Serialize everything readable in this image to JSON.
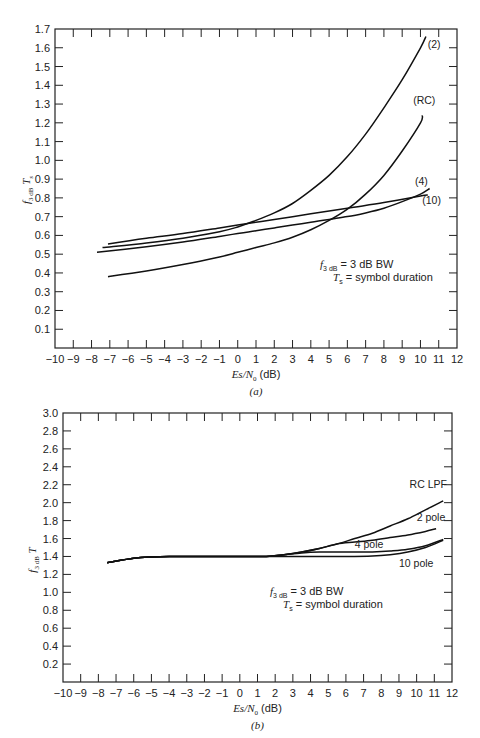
{
  "chart_data": [
    {
      "id": "a",
      "type": "line",
      "caption": "(a)",
      "xlabel": "Es/N0 (dB)",
      "ylabel": "f3dB Ts",
      "xlim": [
        -10,
        12
      ],
      "ylim": [
        0,
        1.7
      ],
      "xticks": [
        -10,
        -9,
        -8,
        -7,
        -6,
        -5,
        -4,
        -3,
        -2,
        -1,
        0,
        1,
        2,
        3,
        4,
        5,
        6,
        7,
        8,
        9,
        10,
        11,
        12
      ],
      "yticks": [
        0.1,
        0.2,
        0.3,
        0.4,
        0.5,
        0.6,
        0.7,
        0.8,
        0.9,
        1.0,
        1.1,
        1.2,
        1.3,
        1.4,
        1.5,
        1.6,
        1.7
      ],
      "grid": false,
      "annotation": [
        "f3dB = 3 dB BW",
        "Ts = symbol duration"
      ],
      "series": [
        {
          "name": "(2)",
          "x": [
            -7.4,
            -5,
            -3,
            -1,
            0,
            1,
            2,
            3,
            4,
            5,
            6,
            7,
            8,
            9,
            10,
            10.3
          ],
          "y": [
            0.535,
            0.56,
            0.585,
            0.62,
            0.645,
            0.68,
            0.72,
            0.77,
            0.84,
            0.92,
            1.02,
            1.14,
            1.28,
            1.43,
            1.6,
            1.66
          ],
          "label_pos": [
            10.4,
            1.6
          ]
        },
        {
          "name": "(RC)",
          "x": [
            -7.1,
            -5,
            -3,
            -1,
            0,
            1,
            2,
            3,
            4,
            5,
            6,
            7,
            8,
            9,
            10,
            10.1
          ],
          "y": [
            0.38,
            0.41,
            0.445,
            0.485,
            0.51,
            0.535,
            0.56,
            0.59,
            0.63,
            0.68,
            0.74,
            0.82,
            0.92,
            1.05,
            1.2,
            1.24
          ],
          "label_pos": [
            9.6,
            1.3
          ]
        },
        {
          "name": "(4)",
          "x": [
            -7.7,
            -5,
            -3,
            -1,
            0,
            1,
            2,
            3,
            4,
            5,
            6,
            7,
            8,
            9,
            10,
            10.5
          ],
          "y": [
            0.51,
            0.54,
            0.565,
            0.595,
            0.61,
            0.625,
            0.64,
            0.655,
            0.67,
            0.685,
            0.7,
            0.72,
            0.745,
            0.78,
            0.82,
            0.85
          ],
          "label_pos": [
            9.7,
            0.87
          ]
        },
        {
          "name": "(10)",
          "x": [
            -7.1,
            -5,
            -3,
            -1,
            0,
            2,
            4,
            6,
            8,
            10,
            10.4
          ],
          "y": [
            0.555,
            0.585,
            0.61,
            0.64,
            0.655,
            0.685,
            0.715,
            0.745,
            0.775,
            0.81,
            0.815
          ],
          "label_pos": [
            10.1,
            0.77
          ]
        }
      ]
    },
    {
      "id": "b",
      "type": "line",
      "caption": "(b)",
      "xlabel": "Es/N0 (dB)",
      "ylabel": "f3dB T",
      "xlim": [
        -10,
        12
      ],
      "ylim": [
        0,
        3.0
      ],
      "xticks": [
        -10,
        -9,
        -8,
        -7,
        -6,
        -5,
        -4,
        -3,
        -2,
        -1,
        0,
        1,
        2,
        3,
        4,
        5,
        6,
        7,
        8,
        9,
        10,
        11,
        12
      ],
      "yticks": [
        0.2,
        0.4,
        0.6,
        0.8,
        1.0,
        1.2,
        1.4,
        1.6,
        1.8,
        2.0,
        2.2,
        2.4,
        2.6,
        2.8,
        3.0
      ],
      "grid": false,
      "annotation": [
        "f3dB = 3 dB BW",
        "Ts = symbol duration"
      ],
      "series": [
        {
          "name": "RC LPF",
          "x": [
            -7.5,
            -6,
            -5,
            -4,
            -2,
            0,
            1.5,
            2.5,
            3.5,
            4.5,
            5.5,
            6.5,
            7.5,
            8.5,
            9.5,
            10.5,
            11.5
          ],
          "y": [
            1.33,
            1.38,
            1.395,
            1.4,
            1.4,
            1.4,
            1.4,
            1.42,
            1.45,
            1.49,
            1.54,
            1.6,
            1.66,
            1.74,
            1.82,
            1.92,
            2.02
          ],
          "label_pos": [
            9.6,
            2.16
          ]
        },
        {
          "name": "2 pole",
          "x": [
            -7.5,
            -6,
            -5,
            -4,
            -2,
            0,
            1.5,
            2.5,
            3.5,
            4.5,
            5.5,
            6.5,
            7.5,
            8.5,
            9.5,
            10.5,
            11.1
          ],
          "y": [
            1.33,
            1.38,
            1.395,
            1.4,
            1.4,
            1.4,
            1.4,
            1.42,
            1.45,
            1.49,
            1.54,
            1.56,
            1.58,
            1.61,
            1.64,
            1.68,
            1.71
          ],
          "label_pos": [
            10.0,
            1.8
          ]
        },
        {
          "name": "4 pole",
          "x": [
            -7.5,
            -6,
            -5,
            -4,
            -2,
            0,
            1.5,
            2.5,
            3.5,
            4.5,
            5.5,
            6.5,
            7.5,
            8.5,
            9.5,
            10.5,
            11.5
          ],
          "y": [
            1.33,
            1.38,
            1.395,
            1.4,
            1.4,
            1.4,
            1.4,
            1.42,
            1.44,
            1.45,
            1.45,
            1.45,
            1.45,
            1.46,
            1.48,
            1.52,
            1.59
          ],
          "label_pos": [
            6.5,
            1.49
          ]
        },
        {
          "name": "10 pole",
          "x": [
            -7.5,
            -6,
            -5,
            -4,
            -2,
            0,
            2,
            4,
            6,
            7.5,
            8.5,
            9.5,
            10.5,
            11.5
          ],
          "y": [
            1.33,
            1.38,
            1.395,
            1.4,
            1.4,
            1.4,
            1.4,
            1.4,
            1.4,
            1.405,
            1.42,
            1.45,
            1.5,
            1.58
          ],
          "label_pos": [
            9.0,
            1.28
          ]
        }
      ]
    }
  ],
  "figure": {
    "panel_a": {
      "ylabel_main": "f",
      "ylabel_sub": "3 dB",
      "ylabel_tail": "T",
      "ylabel_tail_sub": "s",
      "xlabel_main": "Es/N",
      "xlabel_sub": "0",
      "xlabel_unit": " (dB)",
      "caption": "(a)",
      "note_line1_unit": " = 3 dB BW",
      "note_line2": " = symbol duration"
    },
    "panel_b": {
      "ylabel_main": "f",
      "ylabel_sub": "3 dB",
      "ylabel_tail": "T",
      "xlabel_main": "Es/N",
      "xlabel_sub": "0",
      "xlabel_unit": " (dB)",
      "caption": "(b)",
      "note_line1_unit": " = 3 dB BW",
      "note_line2": " = symbol duration"
    },
    "line_color": "#111111",
    "axis_color": "#222222"
  }
}
